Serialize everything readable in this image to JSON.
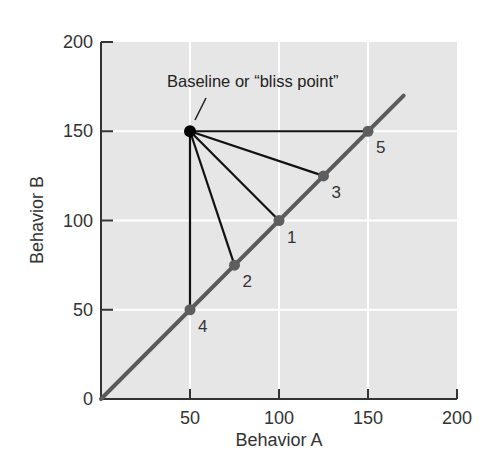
{
  "chart_data": {
    "type": "scatter",
    "title": "",
    "xlabel": "Behavior A",
    "ylabel": "Behavior B",
    "xlim": [
      0,
      200
    ],
    "ylim": [
      0,
      200
    ],
    "x_ticks": [
      0,
      50,
      100,
      150,
      200
    ],
    "y_ticks": [
      0,
      50,
      100,
      150,
      200
    ],
    "x_tick_labels": [
      "50",
      "100",
      "150",
      "200"
    ],
    "y_tick_labels": [
      "0",
      "50",
      "100",
      "150",
      "200"
    ],
    "grid": true,
    "legend": null,
    "bliss_point": {
      "x": 50,
      "y": 150,
      "label": "Baseline or “bliss point”"
    },
    "constraint_line": {
      "from": [
        0,
        0
      ],
      "to": [
        170,
        170
      ]
    },
    "points": [
      {
        "label": "1",
        "x": 100,
        "y": 100
      },
      {
        "label": "2",
        "x": 75,
        "y": 75
      },
      {
        "label": "3",
        "x": 125,
        "y": 125
      },
      {
        "label": "4",
        "x": 50,
        "y": 50
      },
      {
        "label": "5",
        "x": 150,
        "y": 150
      }
    ],
    "connections": "each numbered point is connected by a straight line to the bliss point"
  },
  "colors": {
    "plot_bg": "#e6e6e6",
    "grid": "#ffffff",
    "axis": "#333333",
    "constraint_line": "#5a5a5a",
    "point": "#5e5e5e",
    "bliss_point": "#000000",
    "connector": "#111111"
  }
}
